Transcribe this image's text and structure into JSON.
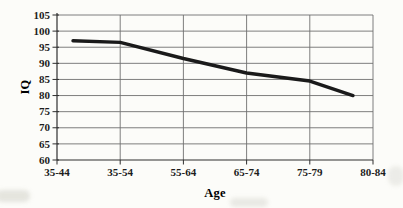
{
  "figure": {
    "background": "#fcfcf9",
    "text_color": "#1c1c1c",
    "gridline_color": "#6f6f6f",
    "axis_color": "#2e2e2e",
    "line_color": "#1a1a1a"
  },
  "chart_data": {
    "type": "line",
    "title": "",
    "xlabel": "Age",
    "ylabel": "IQ",
    "categories": [
      "35-44",
      "35-54",
      "55-64",
      "65-74",
      "75-79",
      "80-84"
    ],
    "series": [
      {
        "name": "IQ",
        "values": [
          97,
          96.5,
          91.5,
          87,
          84.5,
          80
        ]
      }
    ],
    "ylim": [
      60,
      105
    ],
    "yticks": [
      60,
      65,
      70,
      75,
      80,
      85,
      90,
      95,
      100,
      105
    ],
    "ytick_step": 5,
    "grid": "both",
    "legend": "none"
  }
}
